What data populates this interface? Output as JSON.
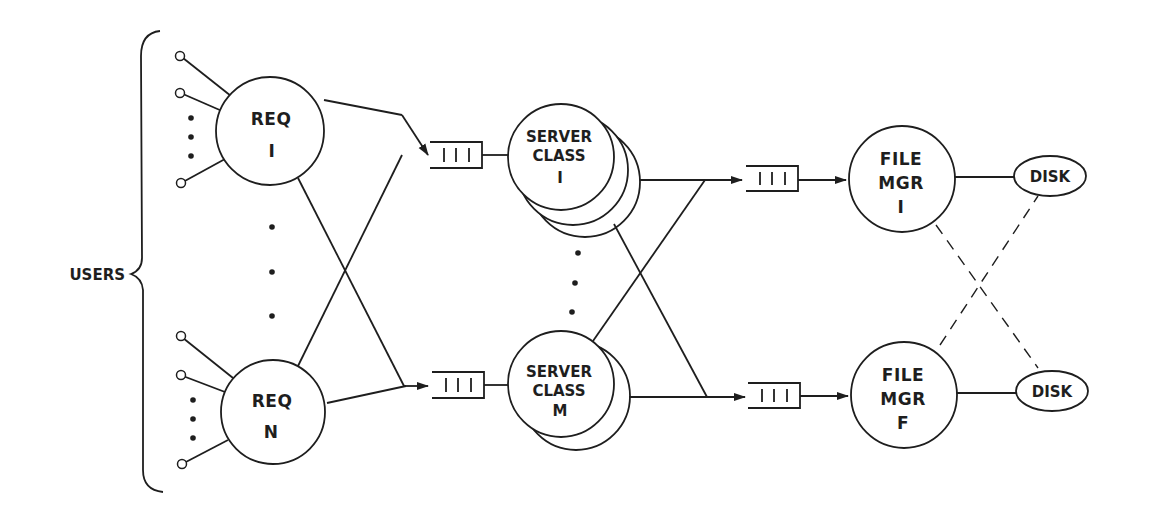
{
  "diagram": {
    "users_label": "USERS",
    "requestors": [
      {
        "line1": "REQ",
        "line2": "I"
      },
      {
        "line1": "REQ",
        "line2": "N"
      }
    ],
    "server_classes": [
      {
        "line1": "SERVER",
        "line2": "CLASS",
        "line3": "I",
        "stack_count": 3
      },
      {
        "line1": "SERVER",
        "line2": "CLASS",
        "line3": "M",
        "stack_count": 2
      }
    ],
    "file_managers": [
      {
        "line1": "FILE",
        "line2": "MGR",
        "line3": "I"
      },
      {
        "line1": "FILE",
        "line2": "MGR",
        "line3": "F"
      }
    ],
    "disks": [
      {
        "label": "DISK"
      },
      {
        "label": "DISK"
      }
    ],
    "queue_glyph": "| | |",
    "colors": {
      "ink": "#1e1e1e",
      "background": "#ffffff"
    }
  }
}
